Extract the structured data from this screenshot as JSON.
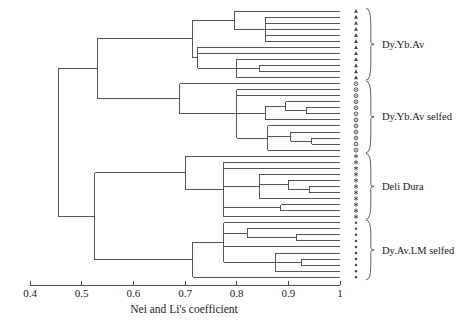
{
  "chart_data": {
    "type": "tree",
    "title": "",
    "xlabel": "Nei and Li's coefficient",
    "ylabel": "",
    "xlim": [
      0.4,
      1.0
    ],
    "grid": false,
    "legend_position": "right",
    "axis": {
      "ticks": [
        {
          "value": 0.4,
          "label": "0.4"
        },
        {
          "value": 0.5,
          "label": "0.5"
        },
        {
          "value": 0.6,
          "label": "0.6"
        },
        {
          "value": 0.7,
          "label": "0.7"
        },
        {
          "value": 0.8,
          "label": "0.8"
        },
        {
          "value": 0.9,
          "label": "0.9"
        },
        {
          "value": 1.0,
          "label": "1"
        }
      ]
    },
    "groups": [
      {
        "label": "Dy.Yb.Av",
        "marker": "triangle",
        "leaf_start": 0,
        "leaf_count": 12
      },
      {
        "label": "Dy.Yb.Av selfed",
        "marker": "circle",
        "leaf_start": 12,
        "leaf_count": 12
      },
      {
        "label": "Deli Dura",
        "marker": "asterisk",
        "leaf_start": 24,
        "leaf_count": 11
      },
      {
        "label": "Dy.Av.LM selfed",
        "marker": "dot",
        "leaf_start": 35,
        "leaf_count": 10
      }
    ],
    "leaf_count_total": 45,
    "leaf_merge_values": [
      0.795,
      0.855,
      0.855,
      0.855,
      0.855,
      0.855,
      0.795,
      0.795,
      0.795,
      0.795,
      0.795,
      0.795,
      0.795,
      0.795,
      0.875,
      0.91,
      0.94,
      0.94,
      0.875,
      0.875,
      0.93,
      0.955,
      0.955,
      0.93,
      0.855,
      0.875,
      0.905,
      0.935,
      0.955,
      0.955,
      0.935,
      0.905,
      0.955,
      0.955,
      0.875,
      0.86,
      0.905,
      0.955,
      0.905,
      0.92,
      0.955,
      0.955,
      0.92,
      0.785,
      0.785
    ],
    "nodes": [
      {
        "id": "root",
        "value": 0.455
      },
      {
        "id": "cladeA",
        "value": 0.53
      },
      {
        "id": "cladeB",
        "value": 0.525
      },
      {
        "id": "group1",
        "value": 0.715
      },
      {
        "id": "group2",
        "value": 0.69
      },
      {
        "id": "group3",
        "value": 0.7
      },
      {
        "id": "group4",
        "value": 0.715
      }
    ]
  },
  "axis_title": "Nei and Li's coefficient"
}
